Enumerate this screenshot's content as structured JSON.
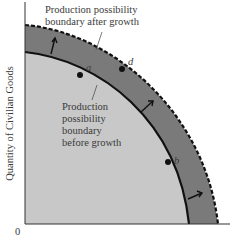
{
  "diagram": {
    "type": "production possibility frontier",
    "y_axis_label": "Quantity of Civilian Goods",
    "origin_label": "0",
    "outer_label_line1": "Production possibility",
    "outer_label_line2": "boundary after growth",
    "inner_label_line1": "Production",
    "inner_label_line2": "possibility",
    "inner_label_line3": "boundary",
    "inner_label_line4": "before growth",
    "points": {
      "a": "a",
      "b": "b",
      "d": "d"
    },
    "colors": {
      "inner_fill": "#c8c8c8",
      "band_fill": "#7a7a7a",
      "curve": "#111111"
    }
  }
}
